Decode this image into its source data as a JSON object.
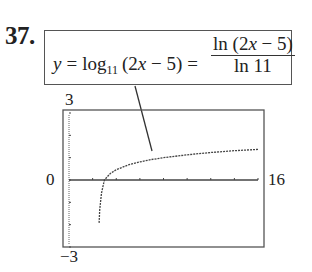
{
  "problem": {
    "number": "37.",
    "equation": {
      "lhs_var": "y",
      "equals": "=",
      "log": "log",
      "base": "11",
      "arg": "(2x − 5)",
      "arg_pre": "(2",
      "arg_x": "x",
      "arg_post": " − 5)",
      "equals2": "=",
      "numerator_pre": "ln (2",
      "numerator_x": "x",
      "numerator_post": " − 5)",
      "denominator": "ln 11"
    }
  },
  "graph": {
    "ymax_label": "3",
    "ymin_label": "−3",
    "xmin_label": "0",
    "xmax_label": "16"
  },
  "chart_data": {
    "type": "line",
    "xlabel": "",
    "ylabel": "",
    "xlim": [
      0,
      16
    ],
    "ylim": [
      -3,
      3
    ],
    "grid": false,
    "series": [
      {
        "name": "y = ln(2x-5)/ln 11",
        "x": [
          2.55,
          2.6,
          2.75,
          3,
          3.5,
          4,
          5,
          6,
          7,
          8,
          10,
          12,
          14,
          16
        ],
        "y": [
          -1.92,
          -1.34,
          -0.58,
          0,
          0.29,
          0.46,
          0.67,
          0.81,
          0.92,
          1.0,
          1.13,
          1.23,
          1.31,
          1.37
        ]
      }
    ]
  }
}
